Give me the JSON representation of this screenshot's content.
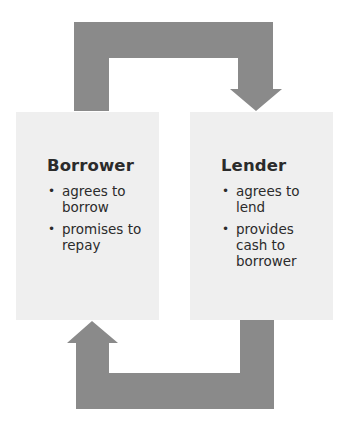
{
  "diagram": {
    "type": "flow-cycle",
    "colors": {
      "arrow": "#8a8a8a",
      "box": "#efefef",
      "text": "#2b2b2b",
      "background": "#ffffff"
    },
    "nodes": [
      {
        "id": "borrower",
        "title": "Borrower",
        "bullets": [
          "agrees to borrow",
          "promises to repay"
        ]
      },
      {
        "id": "lender",
        "title": "Lender",
        "bullets": [
          "agrees to lend",
          "provides cash to borrower"
        ]
      }
    ],
    "edges": [
      {
        "from": "borrower",
        "to": "lender",
        "route": "top"
      },
      {
        "from": "lender",
        "to": "borrower",
        "route": "bottom"
      }
    ],
    "bullet_glyph": "•"
  }
}
